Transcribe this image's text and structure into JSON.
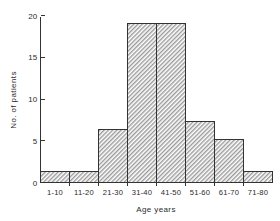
{
  "chart_data": {
    "type": "bar",
    "title": "",
    "subtitle": "",
    "xlabel": "Age   years",
    "ylabel": "No. of patients",
    "categories": [
      "1-10",
      "11-20",
      "21-30",
      "31-40",
      "41-50",
      "51-60",
      "61-70",
      "71-80"
    ],
    "values": [
      1.3,
      1.3,
      6.4,
      19,
      19,
      7.3,
      5.2,
      1.3
    ],
    "ylim": [
      0,
      20
    ],
    "xlim_labels": [
      "1-10",
      "71-80"
    ],
    "y_ticks": [
      "0",
      "5",
      "10",
      "15",
      "20"
    ],
    "y_tick_values": [
      0,
      5,
      10,
      15,
      20
    ],
    "grid": false,
    "legend": false,
    "legend_position": "none",
    "bar_fill": "#bfbfbf",
    "bar_edge": "#333333",
    "axis_color": "#333333",
    "background": "#ffffff",
    "annotations": []
  },
  "axis": {
    "y_title": "No. of patients",
    "x_title": "Age   years"
  }
}
